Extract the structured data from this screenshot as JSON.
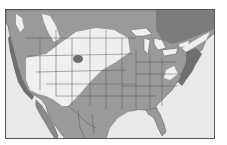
{
  "map": {
    "title": "",
    "region": "North America (USA, southern Canada, northern Mexico)",
    "legend": [],
    "colors": {
      "water": "#e9e9e9",
      "land_outside_range": "#9a9a9a",
      "range_light": "#efefef",
      "range_dark": "#6f6f6f",
      "borders": "#5a5a5a",
      "frame": "#555555"
    }
  }
}
